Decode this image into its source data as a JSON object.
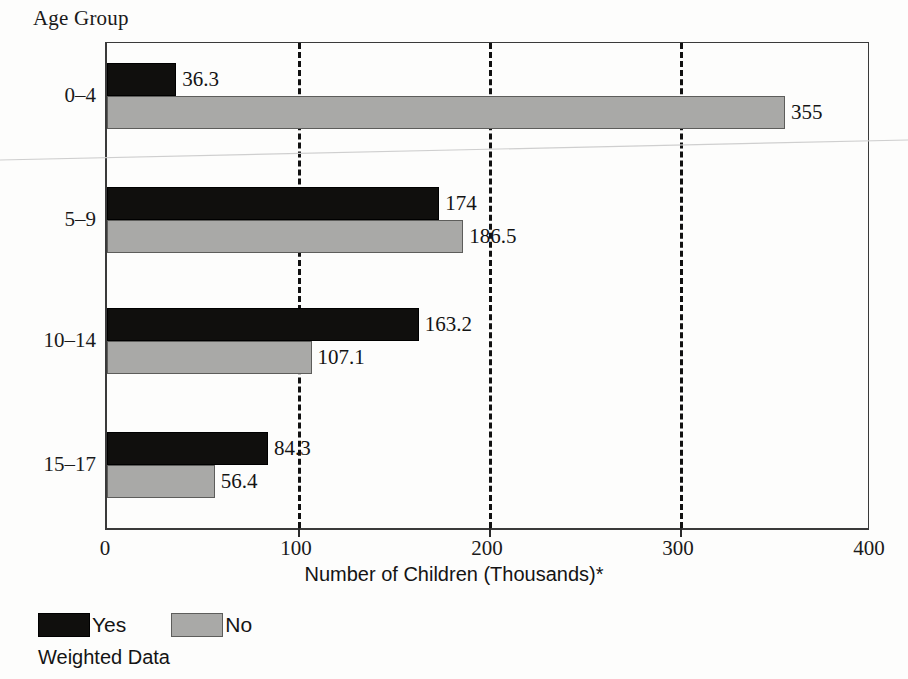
{
  "chart_data": {
    "type": "bar",
    "orientation": "horizontal",
    "title": "Age Group",
    "xlabel": "Number of Children (Thousands)*",
    "ylabel": "Age Group",
    "xlim": [
      0,
      400
    ],
    "xticks": [
      "0",
      "100",
      "200",
      "300",
      "400"
    ],
    "xtick_values": [
      0,
      100,
      200,
      300,
      400
    ],
    "grid": "vertical dashed at 100, 200, 300",
    "legend_position": "below-left",
    "categories": [
      "0–4",
      "5–9",
      "10–14",
      "15–17"
    ],
    "series": [
      {
        "name": "Yes",
        "color": "#100f0d",
        "values": [
          36.3,
          174,
          163.2,
          84.3
        ],
        "labels": [
          "36.3",
          "174",
          "163.2",
          "84.3"
        ]
      },
      {
        "name": "No",
        "color": "#a9a9a7",
        "values": [
          355,
          186.5,
          107.1,
          56.4
        ],
        "labels": [
          "355",
          "186.5",
          "107.1",
          "56.4"
        ]
      }
    ],
    "footnote": "Weighted Data"
  },
  "legend": {
    "yes_label": "Yes",
    "no_label": "No"
  },
  "axis": {
    "title": "Age Group",
    "x_title": "Number of Children (Thousands)*"
  },
  "footnote": "Weighted Data"
}
